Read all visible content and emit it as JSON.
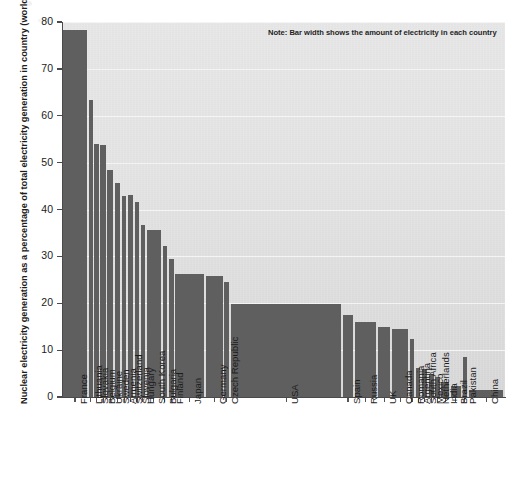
{
  "chart_data": {
    "type": "bar",
    "title": "",
    "subtitle": "",
    "xlabel": "",
    "ylabel": "Nuclear electricity generation as a percentage of total electricity generation in country (world 15%)",
    "ylim": [
      0,
      80
    ],
    "yticks": [
      0,
      10,
      20,
      30,
      40,
      50,
      60,
      70,
      80
    ],
    "grid": true,
    "legend": false,
    "annotations": [
      "Note: Bar width shows the amount of electricity in each country"
    ],
    "bar_color": "#5f5f5f",
    "plot_background": "#e2e2e2",
    "note": "Bar width encodes total electricity generated by each country (variable-width bar chart / Marimekko style)",
    "categories": [
      "France",
      "Lithuania",
      "Slovakia",
      "Belgium",
      "Ukraine",
      "Sweden",
      "Armenia",
      "Switzerland",
      "Slovenia",
      "Hungary",
      "South Korea",
      "Bulgaria",
      "Finland",
      "Japan",
      "Germany",
      "Czech Republic",
      "USA",
      "Spain",
      "Russia",
      "UK",
      "Canada",
      "Romania",
      "Argentina",
      "South Africa",
      "Mexico",
      "Netherlands",
      "India",
      "Brazil",
      "Pakistan",
      "China"
    ],
    "values": [
      78.2,
      63.4,
      54.0,
      53.7,
      48.5,
      45.6,
      42.8,
      43.0,
      41.7,
      36.6,
      35.6,
      32.2,
      29.4,
      26.2,
      25.9,
      24.5,
      19.8,
      17.5,
      16.0,
      14.9,
      14.5,
      12.3,
      6.1,
      6.0,
      4.9,
      4.3,
      3.1,
      2.4,
      8.5,
      1.5
    ],
    "widths": [
      10.0,
      1.8,
      1.8,
      2.2,
      2.4,
      2.4,
      1.8,
      2.2,
      1.8,
      1.8,
      6.0,
      1.8,
      2.2,
      12.0,
      7.0,
      2.2,
      46.0,
      4.2,
      9.0,
      5.2,
      6.8,
      1.8,
      2.0,
      2.2,
      2.0,
      1.8,
      3.2,
      4.4,
      1.8,
      14.5
    ],
    "value_unit": "%"
  },
  "axis": {
    "y_tick_labels": [
      "0",
      "10",
      "20",
      "30",
      "40",
      "50",
      "60",
      "70",
      "80"
    ]
  }
}
